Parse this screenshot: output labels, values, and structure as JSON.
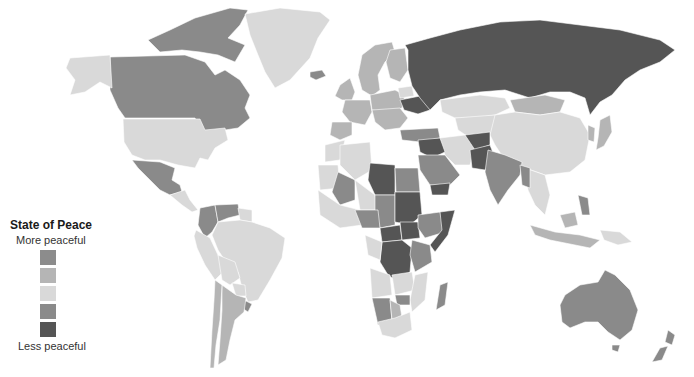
{
  "legend": {
    "title": "State of Peace",
    "top_label": "More peaceful",
    "bottom_label": "Less peaceful",
    "levels": [
      {
        "level": 1,
        "color": "#8c8c8c"
      },
      {
        "level": 2,
        "color": "#b5b5b5"
      },
      {
        "level": 3,
        "color": "#d9d9d9"
      },
      {
        "level": 4,
        "color": "#8a8a8a"
      },
      {
        "level": 5,
        "color": "#555555"
      }
    ]
  },
  "regions": [
    {
      "name": "canada",
      "level": 4
    },
    {
      "name": "canada-arctic",
      "level": 4
    },
    {
      "name": "alaska",
      "level": 3
    },
    {
      "name": "usa",
      "level": 3
    },
    {
      "name": "greenland",
      "level": 3
    },
    {
      "name": "iceland",
      "level": 4
    },
    {
      "name": "mexico",
      "level": 4
    },
    {
      "name": "central-america",
      "level": 3
    },
    {
      "name": "colombia",
      "level": 4
    },
    {
      "name": "venezuela",
      "level": 4
    },
    {
      "name": "guianas",
      "level": 3
    },
    {
      "name": "ecuador-peru",
      "level": 3
    },
    {
      "name": "brazil",
      "level": 3
    },
    {
      "name": "bolivia",
      "level": 3
    },
    {
      "name": "paraguay",
      "level": 3
    },
    {
      "name": "uruguay",
      "level": 4
    },
    {
      "name": "argentina",
      "level": 2
    },
    {
      "name": "chile",
      "level": 2
    },
    {
      "name": "scandinavia",
      "level": 2
    },
    {
      "name": "finland",
      "level": 2
    },
    {
      "name": "uk-ireland",
      "level": 2
    },
    {
      "name": "western-europe",
      "level": 2
    },
    {
      "name": "iberia",
      "level": 2
    },
    {
      "name": "central-europe",
      "level": 2
    },
    {
      "name": "balkans",
      "level": 2
    },
    {
      "name": "ukraine",
      "level": 5
    },
    {
      "name": "belarus",
      "level": 3
    },
    {
      "name": "russia",
      "level": 5
    },
    {
      "name": "turkey",
      "level": 4
    },
    {
      "name": "kazakhstan",
      "level": 3
    },
    {
      "name": "central-asia",
      "level": 3
    },
    {
      "name": "mongolia",
      "level": 2
    },
    {
      "name": "china",
      "level": 3
    },
    {
      "name": "korea",
      "level": 2
    },
    {
      "name": "japan",
      "level": 2
    },
    {
      "name": "iran",
      "level": 3
    },
    {
      "name": "afghanistan",
      "level": 5
    },
    {
      "name": "pakistan",
      "level": 5
    },
    {
      "name": "india",
      "level": 4
    },
    {
      "name": "southeast-asia",
      "level": 3
    },
    {
      "name": "myanmar",
      "level": 4
    },
    {
      "name": "indonesia",
      "level": 2
    },
    {
      "name": "philippines",
      "level": 4
    },
    {
      "name": "png",
      "level": 3
    },
    {
      "name": "syria-iraq",
      "level": 5
    },
    {
      "name": "saudi-arabia",
      "level": 4
    },
    {
      "name": "yemen",
      "level": 5
    },
    {
      "name": "morocco",
      "level": 3
    },
    {
      "name": "algeria",
      "level": 3
    },
    {
      "name": "libya",
      "level": 5
    },
    {
      "name": "egypt",
      "level": 4
    },
    {
      "name": "mauritania",
      "level": 3
    },
    {
      "name": "mali",
      "level": 4
    },
    {
      "name": "niger",
      "level": 3
    },
    {
      "name": "chad",
      "level": 4
    },
    {
      "name": "sudan",
      "level": 5
    },
    {
      "name": "west-africa",
      "level": 3
    },
    {
      "name": "nigeria",
      "level": 4
    },
    {
      "name": "car",
      "level": 5
    },
    {
      "name": "south-sudan",
      "level": 5
    },
    {
      "name": "ethiopia",
      "level": 4
    },
    {
      "name": "somalia",
      "level": 5
    },
    {
      "name": "drc",
      "level": 5
    },
    {
      "name": "gabon-congo",
      "level": 3
    },
    {
      "name": "east-africa",
      "level": 4
    },
    {
      "name": "angola",
      "level": 3
    },
    {
      "name": "zambia",
      "level": 3
    },
    {
      "name": "mozambique",
      "level": 3
    },
    {
      "name": "zimbabwe",
      "level": 4
    },
    {
      "name": "namibia",
      "level": 4
    },
    {
      "name": "botswana",
      "level": 2
    },
    {
      "name": "south-africa",
      "level": 3
    },
    {
      "name": "madagascar",
      "level": 4
    },
    {
      "name": "australia",
      "level": 4
    },
    {
      "name": "new-zealand",
      "level": 4
    }
  ]
}
